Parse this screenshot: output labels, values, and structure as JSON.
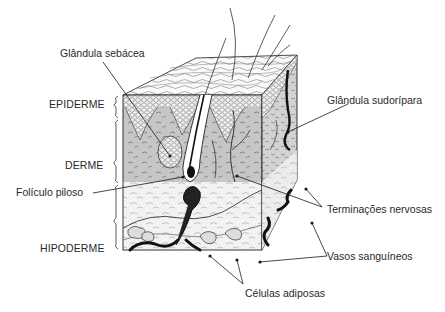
{
  "diagram": {
    "layers": [
      {
        "id": "epiderme",
        "label": "EPIDERME"
      },
      {
        "id": "derme",
        "label": "DERME"
      },
      {
        "id": "hipoderme",
        "label": "HIPODERME"
      }
    ],
    "structures": [
      {
        "id": "glandula-sebacea",
        "label": "Glândula sebácea"
      },
      {
        "id": "glandula-sudoripara",
        "label": "Glândula sudorípara"
      },
      {
        "id": "foliculo-piloso",
        "label": "Folículo piloso"
      },
      {
        "id": "terminacoes-nervosas",
        "label": "Terminações nervosas"
      },
      {
        "id": "vasos-sanguineos",
        "label": "Vasos sanguíneos"
      },
      {
        "id": "celulas-adiposas",
        "label": "Células adiposas"
      }
    ],
    "colors": {
      "background": "#ffffff",
      "ink": "#1a1a1a",
      "derme_fill": "#c9c9c9",
      "epiderme_fill": "#eeeeee",
      "hipoderme_fill": "#f3f3f3",
      "label_text": "#2a2a2a"
    }
  }
}
